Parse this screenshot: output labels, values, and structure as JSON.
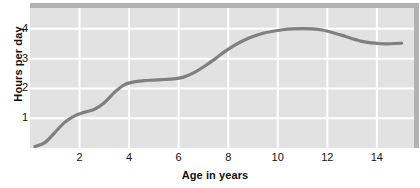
{
  "chart_data": {
    "type": "line",
    "title": "",
    "xlabel": "Age in years",
    "ylabel": "Hours per day",
    "xlim": [
      0,
      15.5
    ],
    "ylim": [
      0,
      4.7
    ],
    "xticks": [
      2,
      4,
      6,
      8,
      10,
      12,
      14
    ],
    "yticks": [
      1,
      2,
      3,
      4
    ],
    "grid": true,
    "legend": null,
    "series": [
      {
        "name": "Hours per day",
        "x": [
          0.2,
          0.6,
          1.0,
          1.4,
          1.8,
          2.2,
          2.6,
          3.0,
          3.4,
          3.8,
          4.2,
          4.6,
          5.0,
          5.4,
          5.8,
          6.2,
          6.6,
          7.0,
          7.4,
          7.8,
          8.2,
          8.6,
          9.0,
          9.4,
          9.8,
          10.2,
          10.6,
          11.0,
          11.4,
          11.8,
          12.2,
          12.6,
          13.0,
          13.4,
          13.8,
          14.2,
          14.6,
          15.0
        ],
        "y": [
          0.05,
          0.18,
          0.52,
          0.86,
          1.08,
          1.2,
          1.3,
          1.52,
          1.86,
          2.12,
          2.22,
          2.26,
          2.28,
          2.3,
          2.32,
          2.38,
          2.52,
          2.72,
          2.95,
          3.2,
          3.42,
          3.6,
          3.74,
          3.85,
          3.92,
          3.97,
          4.0,
          4.01,
          4.0,
          3.96,
          3.88,
          3.78,
          3.67,
          3.58,
          3.53,
          3.5,
          3.5,
          3.52
        ]
      }
    ],
    "style": {
      "panel_color": "#e2e2e2",
      "grid_color": "#ffffff",
      "line_color": "#808080",
      "shadow_color": "#b2b2b2",
      "text_color": "#111111"
    }
  }
}
